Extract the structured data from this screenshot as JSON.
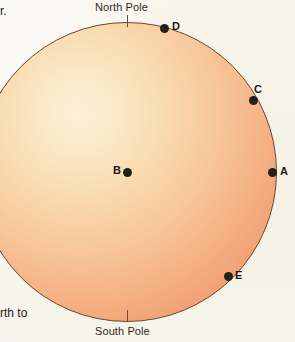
{
  "figure": {
    "type": "globe-diagram",
    "colors": {
      "page_background": "#f7f4ea",
      "globe_highlight": "#fdf0d6",
      "globe_midtone": "#f7c79a",
      "globe_shadow": "#ed8f60",
      "globe_outline": "#6e4330",
      "point_marker": "#24201c",
      "text": "#211e1b"
    },
    "globe": {
      "center_x": 127,
      "center_y": 172,
      "radius": 150
    },
    "poles": [
      {
        "id": "north",
        "label": "North Pole",
        "tick_x": 127,
        "tick_y": 21
      },
      {
        "id": "south",
        "label": "South Pole",
        "tick_x": 127,
        "tick_y": 316
      }
    ],
    "points": [
      {
        "id": "a",
        "label": "A",
        "x": 272,
        "y": 172,
        "location": "on-circumference-right-equator"
      },
      {
        "id": "b",
        "label": "B",
        "x": 127,
        "y": 172,
        "location": "center-of-globe"
      },
      {
        "id": "c",
        "label": "C",
        "x": 253,
        "y": 100,
        "location": "on-circumference-upper-right"
      },
      {
        "id": "d",
        "label": "D",
        "x": 164,
        "y": 28,
        "location": "on-circumference-near-north-pole"
      },
      {
        "id": "e",
        "label": "E",
        "x": 228,
        "y": 276,
        "location": "on-circumference-lower-right"
      }
    ]
  },
  "margin_text": {
    "top_left": "r.",
    "bottom_left": "rth to"
  },
  "ghost_text": {
    "top_right": "",
    "upper_left": "",
    "mid_left_large": "",
    "mid_left_small": ""
  }
}
